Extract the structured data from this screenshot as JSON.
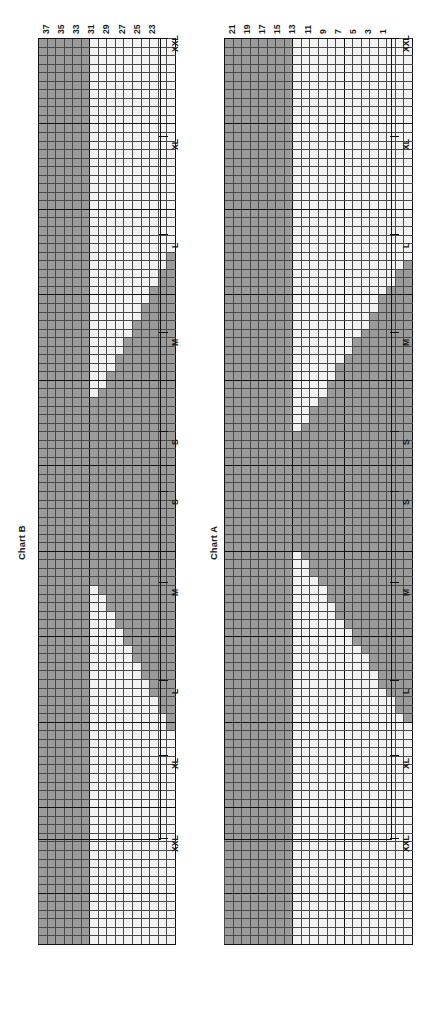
{
  "page": {
    "orientation": "rotated-90-ccw",
    "background": "#ffffff",
    "ink": "#1a1a1a"
  },
  "colors": {
    "shaded_cell": "#9b9b9b",
    "open_cell": "#f2f2f2",
    "grid_line": "#4a4a4a",
    "heavy_line": "#111111"
  },
  "chart_b": {
    "title": "Chart B",
    "note": "Rep rows 37 and 38 for remainder of vest.",
    "row_labels": [
      "37",
      "35",
      "33",
      "31",
      "29",
      "27",
      "25",
      "23"
    ],
    "size_labels": [
      "XXL",
      "XL",
      "L",
      "M",
      "S",
      "S",
      "M",
      "L",
      "XL",
      "XXL"
    ],
    "rows": 16,
    "columns": 106
  },
  "chart_a": {
    "title": "Chart A",
    "note": "Rep rows 21 and 22 until piece measures 10 (11, 12, 12, 13)\", beg chart B.",
    "row_labels": [
      "21",
      "19",
      "17",
      "15",
      "13",
      "11",
      "9",
      "7",
      "5",
      "3",
      "1"
    ],
    "size_labels": [
      "XXL",
      "XL",
      "L",
      "M",
      "S",
      "S",
      "M",
      "L",
      "XL",
      "XXL"
    ],
    "rows": 22,
    "columns": 106
  },
  "chart_data": {
    "type": "heatmap",
    "xlabel": "Stitches (sizes S, M, L, XL, XXL)",
    "ylabel": "Rows",
    "legend": [
      "shaded = MC",
      "open = CC"
    ],
    "charts": [
      {
        "name": "Chart B",
        "rows": 16,
        "columns": 106,
        "row_number_labels": [
          37,
          35,
          33,
          31,
          29,
          27,
          25,
          23
        ],
        "size_marks": [
          "XXL",
          "XL",
          "L",
          "M",
          "S",
          "S",
          "M",
          "L",
          "XL",
          "XXL"
        ],
        "description": "Upper block fully shaded for rows 33-38; rows 23-32 open in center panel with a diagonal staircase of shaded cells rising left-to-right on both halves (armhole/neck shaping)."
      },
      {
        "name": "Chart A",
        "rows": 22,
        "columns": 106,
        "row_number_labels": [
          21,
          19,
          17,
          15,
          13,
          11,
          9,
          7,
          5,
          3,
          1
        ],
        "size_marks": [
          "XXL",
          "XL",
          "L",
          "M",
          "S",
          "S",
          "M",
          "L",
          "XL",
          "XXL"
        ],
        "description": "Rows 15-22 shaded across full width; rows 1-14 open in the body with a diagonal staircase of shaded cells forming the side-seam increase."
      }
    ]
  }
}
